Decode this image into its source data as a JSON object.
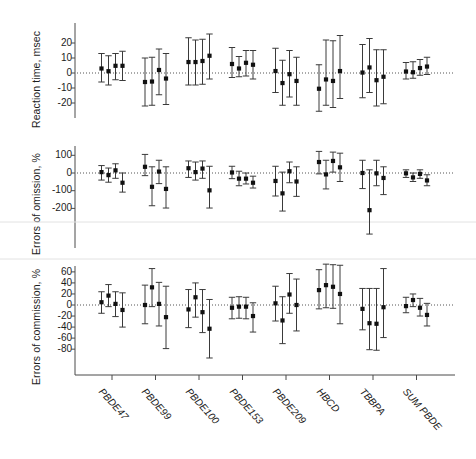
{
  "figure": {
    "background": "#ffffff",
    "marker_color": "#111111",
    "line_color": "#3a3a3a",
    "groups": [
      "PBDE47",
      "PBDE99",
      "PBDE100",
      "PBDE153",
      "PBDE209",
      "HBCD",
      "TBBPA",
      "SUM PBDE"
    ],
    "points_per_group": 4
  },
  "chart_data": [
    {
      "type": "scatter",
      "panel": 1,
      "title": "",
      "ylabel": "Reaction time, msec",
      "xlabel": "",
      "ylim": [
        -28,
        26
      ],
      "yticks": [
        20,
        10,
        0,
        -10,
        -20
      ],
      "ytick_labels": [
        "20",
        "10",
        "0",
        "-10",
        "-20"
      ],
      "grid": false,
      "reference_line": 0,
      "legend": "none",
      "categories": [
        "PBDE47",
        "PBDE99",
        "PBDE100",
        "PBDE153",
        "PBDE209",
        "HBCD",
        "TBBPA",
        "SUM PBDE"
      ],
      "series": [
        {
          "name": "estimate-1",
          "values": [
            3.0,
            -6.0,
            7.3,
            6.0,
            1.3,
            -10.5,
            0.3,
            1.0
          ],
          "ci_low": [
            -6.0,
            -22.0,
            -8.0,
            -3.0,
            -13.0,
            -25.5,
            -16.5,
            -4.0
          ],
          "ci_high": [
            13.0,
            10.0,
            23.5,
            17.0,
            16.5,
            5.5,
            19.0,
            7.0
          ]
        },
        {
          "name": "estimate-2",
          "values": [
            1.2,
            -5.7,
            7.3,
            3.0,
            -6.7,
            -4.3,
            3.7,
            0.5
          ],
          "ci_low": [
            -8.0,
            -21.5,
            -8.0,
            -2.5,
            -21.5,
            -21.5,
            -13.0,
            -3.5
          ],
          "ci_high": [
            11.5,
            10.5,
            22.0,
            11.0,
            8.5,
            22.0,
            23.0,
            7.5
          ]
        },
        {
          "name": "estimate-3",
          "values": [
            4.8,
            2.0,
            8.0,
            6.8,
            -0.8,
            -5.3,
            -4.8,
            3.3
          ],
          "ci_low": [
            -4.5,
            -14.5,
            -7.5,
            -2.0,
            -16.0,
            -23.0,
            -22.0,
            -1.5
          ],
          "ci_high": [
            13.0,
            16.0,
            22.5,
            15.0,
            15.0,
            21.5,
            15.5,
            9.0
          ]
        },
        {
          "name": "estimate-4",
          "values": [
            4.8,
            -3.7,
            11.5,
            5.5,
            -5.3,
            1.3,
            -2.5,
            4.3
          ],
          "ci_low": [
            -5.0,
            -21.0,
            -4.0,
            -4.0,
            -21.5,
            -17.0,
            -20.5,
            -1.0
          ],
          "ci_high": [
            14.5,
            13.0,
            26.0,
            15.0,
            10.5,
            25.0,
            15.5,
            10.5
          ]
        }
      ]
    },
    {
      "type": "scatter",
      "panel": 2,
      "title": "",
      "ylabel": "Errors of omission, %",
      "xlabel": "",
      "ylim": [
        -320,
        140
      ],
      "yticks": [
        100,
        0,
        -100,
        -200
      ],
      "ytick_labels": [
        "100",
        "0",
        "-100",
        "-200"
      ],
      "grid": false,
      "reference_line": 0,
      "legend": "none",
      "categories": [
        "PBDE47",
        "PBDE99",
        "PBDE100",
        "PBDE153",
        "PBDE209",
        "HBCD",
        "TBBPA",
        "SUM PBDE"
      ],
      "series": [
        {
          "name": "estimate-1",
          "values": [
            5,
            35,
            27,
            3,
            -45,
            62,
            0,
            -2
          ],
          "ci_low": [
            -40,
            -15,
            -25,
            -32,
            -130,
            -5,
            -88,
            -25
          ],
          "ci_high": [
            42,
            105,
            68,
            38,
            38,
            122,
            72,
            18
          ]
        },
        {
          "name": "estimate-2",
          "values": [
            -12,
            -78,
            5,
            -32,
            -115,
            -8,
            -210,
            -25
          ],
          "ci_low": [
            -52,
            -185,
            -40,
            -72,
            -215,
            -90,
            -345,
            -48
          ],
          "ci_high": [
            28,
            35,
            62,
            10,
            5,
            72,
            18,
            0
          ]
        },
        {
          "name": "estimate-3",
          "values": [
            15,
            8,
            25,
            -32,
            10,
            68,
            -2,
            -5
          ],
          "ci_low": [
            -30,
            -60,
            -30,
            -62,
            -55,
            5,
            -72,
            -30
          ],
          "ci_high": [
            52,
            72,
            68,
            0,
            62,
            118,
            72,
            18
          ]
        },
        {
          "name": "estimate-4",
          "values": [
            -55,
            -90,
            -98,
            -55,
            -48,
            32,
            -28,
            -42
          ],
          "ci_low": [
            -108,
            -198,
            -198,
            -85,
            -132,
            -48,
            -122,
            -72
          ],
          "ci_high": [
            0,
            35,
            38,
            -18,
            35,
            112,
            35,
            -10
          ]
        }
      ]
    },
    {
      "type": "scatter",
      "panel": 3,
      "title": "",
      "ylabel": "Errors of commission, %",
      "xlabel": "",
      "ylim": [
        -100,
        80
      ],
      "yticks": [
        60,
        40,
        20,
        0,
        -20,
        -40,
        -60,
        -80
      ],
      "ytick_labels": [
        "60",
        "40",
        "20",
        "0",
        "-20",
        "-40",
        "-60",
        "-80"
      ],
      "grid": false,
      "reference_line": 0,
      "legend": "none",
      "categories": [
        "PBDE47",
        "PBDE99",
        "PBDE100",
        "PBDE153",
        "PBDE209",
        "HBCD",
        "TBBPA",
        "SUM PBDE"
      ],
      "series": [
        {
          "name": "estimate-1",
          "values": [
            5,
            0,
            -8,
            -5,
            3,
            27,
            -7,
            -2
          ],
          "ci_low": [
            -15,
            -34,
            -41,
            -25,
            -29,
            -7,
            -45,
            -14
          ],
          "ci_high": [
            24,
            36,
            28,
            14,
            34,
            64,
            30,
            14
          ]
        },
        {
          "name": "estimate-2",
          "values": [
            17,
            32,
            14,
            -3,
            -28,
            36,
            -33,
            9
          ],
          "ci_low": [
            -3,
            -3,
            -22,
            -24,
            -70,
            -5,
            -81,
            -3
          ],
          "ci_high": [
            37,
            66,
            40,
            15,
            15,
            74,
            30,
            20
          ]
        },
        {
          "name": "estimate-3",
          "values": [
            2,
            2,
            -13,
            -3,
            19,
            33,
            -34,
            -5
          ],
          "ci_low": [
            -21,
            -38,
            -50,
            -25,
            -15,
            -6,
            -82,
            -20
          ],
          "ci_high": [
            24,
            41,
            28,
            14,
            57,
            73,
            30,
            12
          ]
        },
        {
          "name": "estimate-4",
          "values": [
            -9,
            -22,
            -43,
            -20,
            0,
            20,
            -4,
            -18
          ],
          "ci_low": [
            -40,
            -79,
            -96,
            -49,
            -47,
            -34,
            -59,
            -38
          ],
          "ci_high": [
            22,
            34,
            10,
            4,
            47,
            72,
            66,
            3
          ]
        }
      ]
    }
  ]
}
